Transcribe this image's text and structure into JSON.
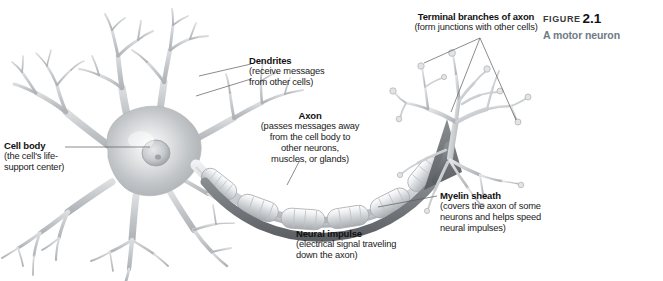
{
  "figure": {
    "label_word": "FIGURE",
    "label_number": "2.1",
    "subtitle": "A motor neuron"
  },
  "callouts": {
    "terminal_branches": {
      "title": "Terminal branches of axon",
      "body": "(form junctions with other cells)"
    },
    "dendrites": {
      "title": "Dendrites",
      "body": "(receive messages\nfrom other cells)"
    },
    "axon": {
      "title": "Axon",
      "body": "(passes messages away\nfrom the cell body to\nother neurons,\nmuscles, or glands)"
    },
    "cell_body": {
      "title": "Cell body",
      "body": "(the cell's life-\nsupport center)"
    },
    "myelin_sheath": {
      "title": "Myelin sheath",
      "body": "(covers the axon of some\nneurons and helps speed\nneural impulses)"
    },
    "neural_impulse": {
      "title": "Neural impulse",
      "body": "(electrical signal traveling\ndown the axon)"
    }
  },
  "colors": {
    "background": "#ffffff",
    "text": "#1a1a1a",
    "caption_subtitle": "#6f7b86",
    "neuron_light": "#e8e9ea",
    "neuron_mid": "#b9bcbf",
    "neuron_dark": "#8d9195",
    "impulse_arrow": "#6e7174",
    "leader_line": "#4a4a4a"
  }
}
